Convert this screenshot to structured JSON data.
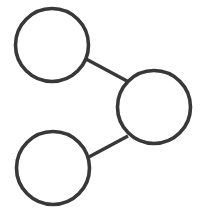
{
  "canvas": {
    "width": 206,
    "height": 210,
    "background_color": "#ffffff",
    "title": "Three-node graph diagram"
  },
  "style": {
    "stroke_color": "#383838",
    "node_fill_color": "#ffffff",
    "node_stroke_width": 3.6,
    "edge_stroke_width": 3.4
  },
  "diagram": {
    "type": "node-link-graph",
    "node_count": 3,
    "edge_count": 2,
    "node_shape": "circle",
    "nodes": [
      {
        "id": "node-top-left",
        "label": "",
        "cx": 52,
        "cy": 45,
        "r": 36.5
      },
      {
        "id": "node-right",
        "label": "",
        "cx": 154,
        "cy": 107,
        "r": 36.5
      },
      {
        "id": "node-bottom-left",
        "label": "",
        "cx": 53,
        "cy": 168,
        "r": 36.5
      }
    ],
    "edges": [
      {
        "id": "edge-top-left-to-right",
        "from": "node-top-left",
        "to": "node-right",
        "x1": 86,
        "y1": 59,
        "x2": 127,
        "y2": 81
      },
      {
        "id": "edge-bottom-left-to-right",
        "from": "node-bottom-left",
        "to": "node-right",
        "x1": 87,
        "y1": 158,
        "x2": 128,
        "y2": 136
      }
    ]
  }
}
